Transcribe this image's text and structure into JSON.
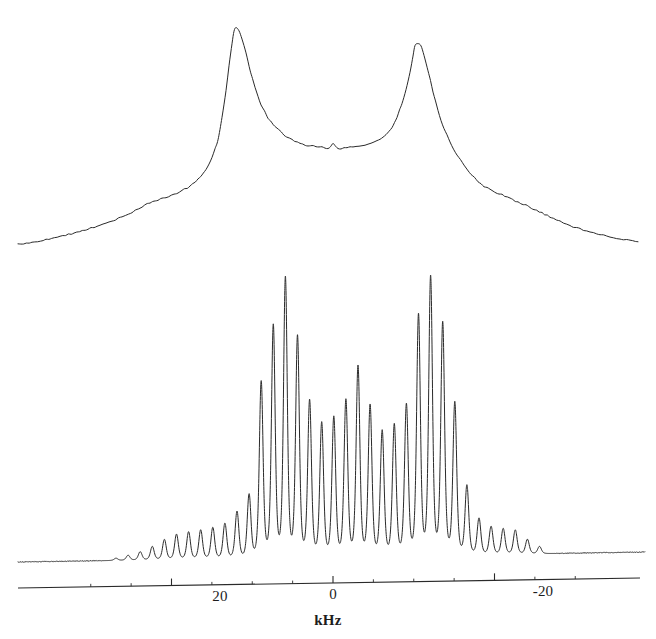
{
  "figure": {
    "title": "",
    "background_color": "#ffffff",
    "trace_color": "#2a2a2a",
    "width": 656,
    "height": 639
  },
  "axis": {
    "name": "frequency-axis",
    "unit_label": "kHz",
    "tick_labels": [
      "20",
      "0",
      "-20"
    ],
    "tick_label_values": [
      20,
      0,
      -20
    ],
    "tick_positions_px": [
      220,
      333,
      543
    ],
    "minor_tick_step_khz": 5,
    "minor_tick_values": [
      30,
      25,
      20,
      15,
      10,
      5,
      0,
      -5,
      -10,
      -15,
      -20,
      -25,
      -30
    ],
    "axis_left_px": 18,
    "axis_right_px": 640,
    "axis_y_left_px": 588,
    "axis_y_right_px": 578,
    "direction": "decreasing-left-to-right"
  },
  "chart_data": [
    {
      "type": "line",
      "name": "static-powder-pattern",
      "title": "Static CSA powder pattern",
      "xlabel": "kHz",
      "ylabel": "",
      "xlim": [
        35,
        -35
      ],
      "ylim": [
        0,
        1
      ],
      "grid": false,
      "legend": "none",
      "annotations": [
        {
          "label": "left horn (sigma_22 edge)",
          "x_khz": 17.5,
          "y": 1.0
        },
        {
          "label": "right horn (sigma_11 edge)",
          "x_khz": -16.0,
          "y": 0.93
        },
        {
          "label": "central trough",
          "x_khz": 0.0,
          "y": 0.46
        }
      ],
      "x": [
        18,
        32,
        46,
        60,
        74,
        88,
        100,
        112,
        122,
        132,
        142,
        150,
        158,
        166,
        174,
        182,
        190,
        198,
        206,
        212,
        218,
        222,
        226,
        229,
        232,
        234,
        236,
        239,
        242,
        246,
        250,
        255,
        261,
        268,
        276,
        284,
        292,
        300,
        308,
        316,
        322,
        328,
        333,
        338,
        344,
        350,
        356,
        362,
        368,
        374,
        380,
        386,
        392,
        397,
        402,
        406,
        410,
        413,
        415,
        418,
        421,
        424,
        428,
        433,
        438,
        444,
        450,
        457,
        464,
        471,
        478,
        484,
        490,
        496,
        502,
        510,
        518,
        526,
        534,
        542,
        550,
        560,
        570,
        580,
        590,
        600,
        610,
        620,
        630,
        638
      ],
      "y": [
        0.012,
        0.022,
        0.035,
        0.048,
        0.063,
        0.082,
        0.098,
        0.118,
        0.138,
        0.158,
        0.183,
        0.203,
        0.216,
        0.228,
        0.24,
        0.256,
        0.278,
        0.308,
        0.352,
        0.408,
        0.492,
        0.59,
        0.712,
        0.83,
        0.93,
        0.985,
        1.0,
        0.985,
        0.95,
        0.885,
        0.81,
        0.728,
        0.65,
        0.588,
        0.545,
        0.512,
        0.49,
        0.474,
        0.463,
        0.458,
        0.456,
        0.452,
        0.47,
        0.45,
        0.452,
        0.456,
        0.458,
        0.462,
        0.468,
        0.478,
        0.492,
        0.512,
        0.545,
        0.592,
        0.655,
        0.72,
        0.8,
        0.875,
        0.92,
        0.93,
        0.915,
        0.875,
        0.805,
        0.71,
        0.62,
        0.54,
        0.478,
        0.42,
        0.372,
        0.332,
        0.3,
        0.278,
        0.262,
        0.25,
        0.238,
        0.222,
        0.205,
        0.19,
        0.172,
        0.155,
        0.138,
        0.118,
        0.098,
        0.082,
        0.068,
        0.056,
        0.046,
        0.038,
        0.03,
        0.024
      ],
      "notes": "y is normalized intensity; x listed in pixel coordinates of the source figure"
    },
    {
      "type": "line",
      "name": "mas-spinning-sideband-manifold",
      "title": "MAS spinning sideband manifold",
      "xlabel": "kHz",
      "ylabel": "",
      "xlim": [
        35,
        -35
      ],
      "ylim": [
        0,
        1
      ],
      "grid": false,
      "legend": "none",
      "peak_spacing_px": 12.1,
      "peak_first_px": 116,
      "peak_count": 36,
      "peak_heights": [
        0.008,
        0.018,
        0.03,
        0.048,
        0.072,
        0.09,
        0.098,
        0.104,
        0.112,
        0.126,
        0.168,
        0.228,
        0.63,
        0.83,
        1.0,
        0.79,
        0.56,
        0.48,
        0.5,
        0.56,
        0.68,
        0.54,
        0.448,
        0.47,
        0.54,
        0.86,
        0.995,
        0.83,
        0.545,
        0.248,
        0.13,
        0.1,
        0.092,
        0.086,
        0.052,
        0.026
      ],
      "annotations": [
        {
          "label": "tallest sideband (left)",
          "x_px": 261,
          "y": 1.0
        },
        {
          "label": "tallest sideband (right)",
          "x_px": 397,
          "y": 0.995
        },
        {
          "label": "isotropic region",
          "x_px": 333,
          "y": 0.47
        }
      ],
      "notes": "Stick-like Lorentzian sidebands on a slightly tilted baseline"
    }
  ]
}
